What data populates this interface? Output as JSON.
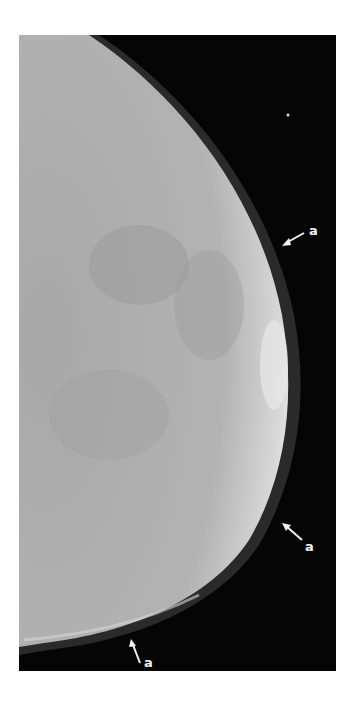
{
  "figure": {
    "annotations": [
      {
        "label": "a",
        "position": "upper-right",
        "arrow_direction": "down-left"
      },
      {
        "label": "a",
        "position": "lower-right",
        "arrow_direction": "up-left"
      },
      {
        "label": "a",
        "position": "bottom",
        "arrow_direction": "up"
      }
    ],
    "colors": {
      "background": "#050505",
      "tissue": "#b5b5b5",
      "dense_edge": "#e6e6e6",
      "annotation": "#f2f2f2"
    }
  }
}
